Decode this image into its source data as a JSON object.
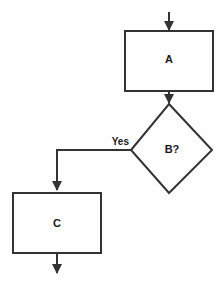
{
  "diagram": {
    "type": "flowchart",
    "background_color": "#fefefe",
    "stroke_color": "#333333",
    "text_color": "#1a1a1a",
    "nodes": [
      {
        "id": "A",
        "shape": "process",
        "label": "A",
        "x": 125,
        "y": 31,
        "width": 88,
        "height": 60
      },
      {
        "id": "B",
        "shape": "decision",
        "label": "B?",
        "x": 131,
        "y": 104,
        "width": 82,
        "height": 89
      },
      {
        "id": "C",
        "shape": "process",
        "label": "C",
        "x": 13,
        "y": 193,
        "width": 88,
        "height": 60
      }
    ],
    "edges": [
      {
        "id": "entry",
        "from": "",
        "to": "A",
        "label": "",
        "arrowhead": true
      },
      {
        "id": "a-to-b",
        "from": "A",
        "to": "B",
        "label": "",
        "arrowhead": true
      },
      {
        "id": "b-to-c",
        "from": "B",
        "to": "C",
        "label": "Yes",
        "arrowhead": true
      },
      {
        "id": "exit",
        "from": "C",
        "to": "",
        "label": "",
        "arrowhead": true
      }
    ]
  }
}
